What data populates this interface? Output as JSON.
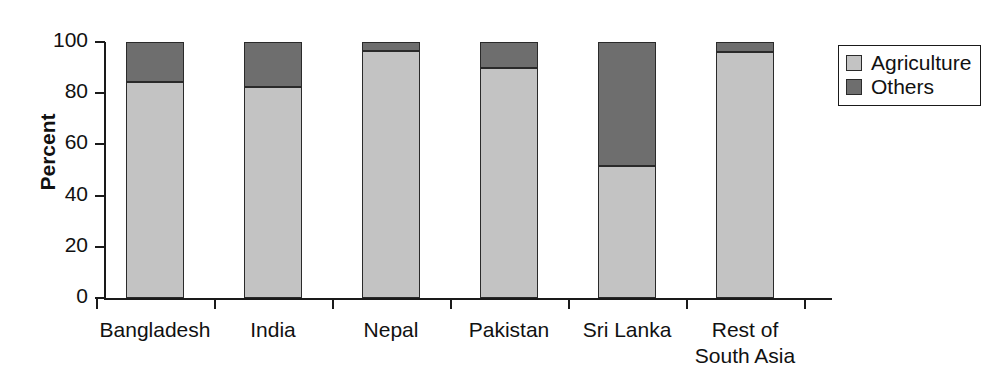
{
  "chart_data": {
    "type": "bar",
    "stacked": true,
    "stack_normalized": true,
    "title": "",
    "subtitle": "",
    "xlabel": "",
    "ylabel": "Percent",
    "ylim": [
      0,
      100
    ],
    "yticks": [
      0,
      20,
      40,
      60,
      80,
      100
    ],
    "ytick_labels": [
      "0",
      "20",
      "40",
      "60",
      "80",
      "100"
    ],
    "grid": false,
    "legend_position": "right",
    "categories": [
      "Bangladesh",
      "India",
      "Nepal",
      "Pakistan",
      "Sri Lanka",
      "Rest of\nSouth Asia"
    ],
    "series": [
      {
        "name": "Agriculture",
        "color": "#c3c3c3",
        "values": [
          84.5,
          82.5,
          96.5,
          90.0,
          51.5,
          96.0
        ]
      },
      {
        "name": "Others",
        "color": "#6e6e6e",
        "values": [
          15.5,
          17.5,
          3.5,
          10.0,
          48.5,
          4.0
        ]
      }
    ]
  },
  "legend": {
    "entries": [
      {
        "label": "Agriculture",
        "color": "#c3c3c3"
      },
      {
        "label": "Others",
        "color": "#6e6e6e"
      }
    ]
  },
  "colors": {
    "agriculture": "#c3c3c3",
    "others": "#6e6e6e",
    "axis": "#1a1a1a",
    "outline": "#2a2a2a",
    "background": "#ffffff"
  }
}
